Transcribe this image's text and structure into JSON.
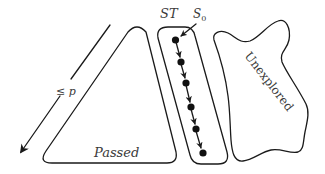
{
  "diagram": {
    "regions": {
      "passed": {
        "label": "Passed"
      },
      "st": {
        "label": "ST"
      },
      "unexplored": {
        "label": "Unexplored"
      }
    },
    "start_state": {
      "label": "S",
      "subscript": "0"
    },
    "depth_arrow": {
      "label": "≤ p"
    },
    "trace_nodes": 6,
    "colors": {
      "stroke": "#1a1a1a",
      "text": "#3a3a3a",
      "background": "#ffffff"
    }
  }
}
